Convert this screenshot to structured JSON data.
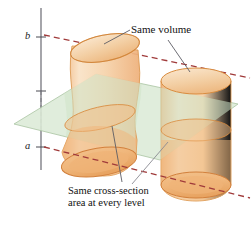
{
  "figure": {
    "axis": {
      "upper_label": "b",
      "lower_label": "a",
      "name": "vertical-axis"
    },
    "annotations": {
      "same_volume": "Same volume",
      "cross_section_line1": "Same cross-section",
      "cross_section_line2": "area at every level"
    },
    "shapes": {
      "left_solid": "curved-oblique-cylinder",
      "right_solid": "right-circular-cylinder",
      "cutting_plane": "horizontal-cross-section-plane"
    },
    "colors": {
      "solid_fill_light": "#f7ddbd",
      "solid_fill_mid": "#f3c89a",
      "solid_fill_deep": "#f0b87e",
      "solid_stroke": "#d98c3f",
      "plane_fill": "#dcebd7",
      "plane_stroke": "#a9c4a2",
      "level_line": "#a03a3a",
      "axis_line": "#6a6a72",
      "leader_line": "#6b6b73",
      "text": "#111111"
    }
  }
}
